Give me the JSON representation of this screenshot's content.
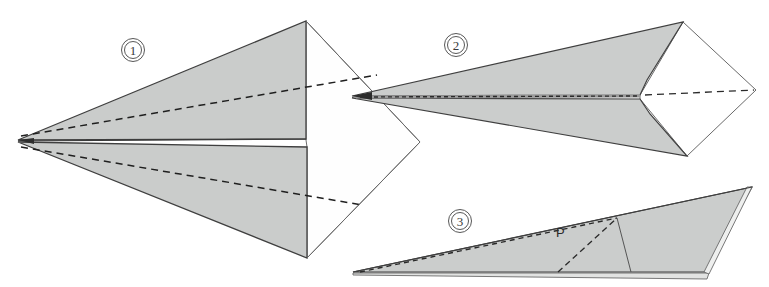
{
  "figure": {
    "background_color": "#ffffff",
    "paper_fill": "#c9cbc9",
    "paper_fill_light": "#d5d7d5",
    "paper_fill_white": "#fdfdfd",
    "outline_color": "#4a4a4a",
    "fold_line_color": "#262626",
    "steps": [
      {
        "id": "step-1",
        "number": "1",
        "label_x": 133,
        "label_y": 50,
        "caption": "Front view of folded dart with wings spread"
      },
      {
        "id": "step-2",
        "number": "2",
        "label_x": 456,
        "label_y": 45,
        "caption": "Top view of completed dart"
      },
      {
        "id": "step-3",
        "number": "3",
        "label_x": 460,
        "label_y": 221,
        "caption": "Side view of completed dart"
      }
    ],
    "annotations": [
      {
        "id": "point-p",
        "text": "P",
        "x": 556,
        "y": 237
      }
    ]
  }
}
